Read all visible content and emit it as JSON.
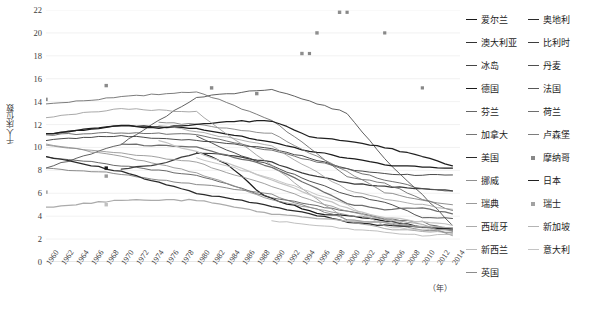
{
  "chart_data": {
    "type": "line",
    "title": "",
    "xlabel": "年",
    "ylabel": "千人床位数",
    "xlim": [
      1960,
      2015
    ],
    "ylim": [
      0,
      22
    ],
    "grid": true,
    "legend_position": "right",
    "x_ticks": [
      "1960",
      "1962",
      "1964",
      "1966",
      "1968",
      "1970",
      "1972",
      "1974",
      "1976",
      "1978",
      "1980",
      "1982",
      "1984",
      "1986",
      "1988",
      "1990",
      "1992",
      "1994",
      "1996",
      "1998",
      "2000",
      "2002",
      "2004",
      "2006",
      "2008",
      "2010",
      "2012",
      "2014"
    ],
    "y_ticks": [
      "0",
      "2",
      "4",
      "6",
      "8",
      "10",
      "12",
      "14",
      "16",
      "18",
      "20",
      "22"
    ],
    "series": [
      {
        "name": "爱尔兰",
        "color": "#1a1a1a",
        "mode": "line",
        "x": [
          1980,
          1982,
          1984,
          1986,
          1988,
          1990,
          1992,
          1994,
          1996,
          1998,
          2000,
          2002,
          2004,
          2006,
          2008,
          2010,
          2012,
          2014
        ],
        "values": [
          9.6,
          9.2,
          8.5,
          7.5,
          6.2,
          5.5,
          5.1,
          4.7,
          4.3,
          4.1,
          4.0,
          3.9,
          3.7,
          3.5,
          3.3,
          3.1,
          2.9,
          2.8
        ]
      },
      {
        "name": "奥地利",
        "color": "#2b2b2b",
        "mode": "line",
        "x": [
          1960,
          1965,
          1970,
          1975,
          1980,
          1985,
          1990,
          1995,
          2000,
          2005,
          2010,
          2014
        ],
        "values": [
          10.6,
          10.9,
          11.0,
          10.8,
          10.6,
          10.3,
          9.9,
          9.1,
          8.1,
          7.7,
          7.6,
          7.6
        ]
      },
      {
        "name": "澳大利亚",
        "color": "#333333",
        "mode": "line",
        "x": [
          1980,
          1985,
          1990,
          1995,
          2000,
          2005,
          2010,
          2014
        ],
        "values": [
          11.0,
          9.5,
          8.4,
          7.1,
          5.9,
          5.2,
          3.9,
          3.8
        ]
      },
      {
        "name": "比利时",
        "color": "#3d3d3d",
        "mode": "line",
        "x": [
          1970,
          1975,
          1980,
          1985,
          1990,
          1995,
          2000,
          2005,
          2010,
          2014
        ],
        "values": [
          8.1,
          8.5,
          9.5,
          9.3,
          8.7,
          7.6,
          6.9,
          6.6,
          6.4,
          6.2
        ]
      },
      {
        "name": "冰岛",
        "color": "#454545",
        "mode": "line",
        "x": [
          1960,
          1970,
          1980,
          1990,
          2000,
          2005,
          2010,
          2014
        ],
        "values": [
          8.2,
          10.3,
          14.4,
          15.1,
          13.0,
          9.0,
          5.9,
          3.2
        ]
      },
      {
        "name": "丹麦",
        "color": "#4f4f4f",
        "mode": "line",
        "x": [
          1960,
          1970,
          1980,
          1990,
          2000,
          2005,
          2010,
          2014
        ],
        "values": [
          9.2,
          8.4,
          7.6,
          5.6,
          4.4,
          3.8,
          3.5,
          2.7
        ]
      },
      {
        "name": "德国",
        "color": "#1c1c1c",
        "mode": "line",
        "x": [
          1960,
          1970,
          1980,
          1990,
          1995,
          2000,
          2005,
          2010,
          2014
        ],
        "values": [
          11.2,
          11.9,
          11.7,
          10.4,
          9.7,
          9.1,
          8.5,
          8.3,
          8.2
        ]
      },
      {
        "name": "法国",
        "color": "#575757",
        "mode": "line",
        "x": [
          1960,
          1970,
          1980,
          1990,
          2000,
          2005,
          2010,
          2014
        ],
        "values": [
          11.1,
          11.3,
          11.1,
          9.7,
          8.1,
          7.2,
          6.4,
          6.2
        ]
      },
      {
        "name": "芬兰",
        "color": "#666666",
        "mode": "line",
        "x": [
          1960,
          1970,
          1980,
          1990,
          2000,
          2005,
          2010,
          2014
        ],
        "values": [
          13.8,
          14.4,
          14.9,
          12.4,
          7.5,
          6.9,
          5.5,
          4.5
        ]
      },
      {
        "name": "荷兰",
        "color": "#6e6e6e",
        "mode": "line",
        "x": [
          1970,
          1980,
          1990,
          2000,
          2005,
          2010,
          2014
        ],
        "values": [
          10.3,
          10.0,
          8.3,
          5.1,
          4.6,
          4.7,
          4.2
        ]
      },
      {
        "name": "加拿大",
        "color": "#757575",
        "mode": "line",
        "x": [
          1960,
          1970,
          1976,
          1980,
          1990,
          2000,
          2005,
          2010,
          2014
        ],
        "values": [
          8.2,
          7.7,
          7.1,
          6.8,
          5.9,
          3.7,
          3.4,
          2.8,
          2.6
        ]
      },
      {
        "name": "卢森堡",
        "color": "#7d7d7d",
        "mode": "line",
        "x": [
          1975,
          1980,
          1990,
          2000,
          2005,
          2010,
          2014
        ],
        "values": [
          12.2,
          12.0,
          11.2,
          7.9,
          6.1,
          5.4,
          5.0
        ]
      },
      {
        "name": "美国",
        "color": "#2a2a2a",
        "mode": "line",
        "x": [
          1960,
          1970,
          1980,
          1990,
          2000,
          2005,
          2010,
          2014
        ],
        "values": [
          9.2,
          7.9,
          6.0,
          4.9,
          3.5,
          3.2,
          3.1,
          2.9
        ]
      },
      {
        "name": "摩纳哥",
        "color": "#888888",
        "mode": "marker",
        "x": [
          1995,
          2000,
          2005,
          2010
        ],
        "values": [
          18.2,
          21.8,
          20.0,
          15.2
        ]
      },
      {
        "name": "挪威",
        "color": "#909090",
        "mode": "line",
        "x": [
          1960,
          1970,
          1980,
          1990,
          2000,
          2005,
          2010,
          2014
        ],
        "values": [
          10.2,
          9.5,
          8.7,
          6.6,
          4.4,
          3.8,
          3.3,
          2.3
        ]
      },
      {
        "name": "日本",
        "color": "#202020",
        "mode": "line",
        "x": [
          1960,
          1965,
          1970,
          1975,
          1980,
          1985,
          1990,
          1995,
          2000,
          2005,
          2010,
          2014
        ],
        "values": [
          11.2,
          11.6,
          11.9,
          11.7,
          12.0,
          12.3,
          12.3,
          11.0,
          10.5,
          10.0,
          9.2,
          8.4
        ]
      },
      {
        "name": "瑞典",
        "color": "#9a9a9a",
        "mode": "line",
        "x": [
          1960,
          1970,
          1980,
          1990,
          2000,
          2005,
          2010,
          2014
        ],
        "values": [
          12.6,
          13.4,
          13.1,
          8.4,
          3.6,
          2.9,
          2.7,
          2.5
        ]
      },
      {
        "name": "瑞士",
        "color": "#a2a2a2",
        "mode": "line",
        "x": [
          1975,
          1980,
          1990,
          2000,
          2005,
          2010,
          2014
        ],
        "values": [
          11.9,
          11.4,
          10.1,
          6.3,
          5.5,
          5.0,
          4.6
        ]
      },
      {
        "name": "西班牙",
        "color": "#ababab",
        "mode": "line",
        "x": [
          1960,
          1970,
          1980,
          1990,
          2000,
          2005,
          2010,
          2014
        ],
        "values": [
          4.8,
          5.4,
          5.4,
          4.2,
          3.6,
          3.4,
          3.1,
          3.0
        ]
      },
      {
        "name": "新加坡",
        "color": "#b4b4b4",
        "mode": "line",
        "x": [
          1990,
          2000,
          2005,
          2010,
          2014
        ],
        "values": [
          3.6,
          2.9,
          2.6,
          2.3,
          2.4
        ]
      },
      {
        "name": "新西兰",
        "color": "#bcbcbc",
        "mode": "line",
        "x": [
          1980,
          1990,
          2000,
          2005,
          2010,
          2014
        ],
        "values": [
          9.1,
          7.3,
          5.0,
          3.1,
          2.8,
          2.8
        ]
      },
      {
        "name": "意大利",
        "color": "#c4c4c4",
        "mode": "line",
        "x": [
          1975,
          1980,
          1990,
          2000,
          2005,
          2010,
          2014
        ],
        "values": [
          10.6,
          9.6,
          7.2,
          4.7,
          3.9,
          3.5,
          3.2
        ]
      },
      {
        "name": "英国",
        "color": "#8c8c8c",
        "mode": "line",
        "x": [
          1960,
          1970,
          1980,
          1990,
          2000,
          2005,
          2010,
          2014
        ],
        "values": [
          10.3,
          9.2,
          7.8,
          5.4,
          4.1,
          3.7,
          3.0,
          2.7
        ]
      }
    ],
    "scatter_points": [
      {
        "name": "芬兰",
        "x": 1960,
        "y": 14.2,
        "color": "#8a8a8a"
      },
      {
        "name": "芬兰",
        "x": 1968,
        "y": 15.4,
        "color": "#8a8a8a"
      },
      {
        "name": "芬兰",
        "x": 1982,
        "y": 15.2,
        "color": "#8a8a8a"
      },
      {
        "name": "芬兰",
        "x": 1988,
        "y": 14.7,
        "color": "#8a8a8a"
      },
      {
        "name": "摩纳哥",
        "x": 1994,
        "y": 18.2,
        "color": "#8e8e8e"
      },
      {
        "name": "摩纳哥",
        "x": 1996,
        "y": 20.0,
        "color": "#8e8e8e"
      },
      {
        "name": "摩纳哥",
        "x": 1999,
        "y": 21.8,
        "color": "#8e8e8e"
      },
      {
        "name": "加拿大",
        "x": 1968,
        "y": 8.2,
        "color": "#1a1a1a"
      },
      {
        "name": "卢森堡",
        "x": 1968,
        "y": 7.5,
        "color": "#9a9a9a"
      },
      {
        "name": "西班牙",
        "x": 1960,
        "y": 6.1,
        "color": "#a8a8a8"
      },
      {
        "name": "新加坡",
        "x": 1968,
        "y": 5.0,
        "color": "#c0c0c0"
      }
    ]
  },
  "axis": {
    "y_title": "千人床位数",
    "x_unit": "（年）"
  },
  "legend": {
    "column1": [
      {
        "label": "爱尔兰",
        "color": "#1a1a1a",
        "mode": "line"
      },
      {
        "label": "澳大利亚",
        "color": "#333333",
        "mode": "line"
      },
      {
        "label": "冰岛",
        "color": "#454545",
        "mode": "line"
      },
      {
        "label": "德国",
        "color": "#1c1c1c",
        "mode": "line"
      },
      {
        "label": "芬兰",
        "color": "#666666",
        "mode": "line"
      },
      {
        "label": "加拿大",
        "color": "#757575",
        "mode": "line"
      },
      {
        "label": "美国",
        "color": "#2a2a2a",
        "mode": "line"
      },
      {
        "label": "挪威",
        "color": "#909090",
        "mode": "line"
      },
      {
        "label": "瑞典",
        "color": "#9a9a9a",
        "mode": "line"
      },
      {
        "label": "西班牙",
        "color": "#ababab",
        "mode": "line"
      },
      {
        "label": "新西兰",
        "color": "#bcbcbc",
        "mode": "line"
      },
      {
        "label": "英国",
        "color": "#8c8c8c",
        "mode": "blank"
      }
    ],
    "column2": [
      {
        "label": "奥地利",
        "color": "#2b2b2b",
        "mode": "line"
      },
      {
        "label": "比利时",
        "color": "#3d3d3d",
        "mode": "line"
      },
      {
        "label": "丹麦",
        "color": "#4f4f4f",
        "mode": "line"
      },
      {
        "label": "法国",
        "color": "#575757",
        "mode": "line"
      },
      {
        "label": "荷兰",
        "color": "#6e6e6e",
        "mode": "line"
      },
      {
        "label": "卢森堡",
        "color": "#7d7d7d",
        "mode": "line"
      },
      {
        "label": "摩纳哥",
        "color": "#888888",
        "mode": "marker"
      },
      {
        "label": "日本",
        "color": "#202020",
        "mode": "line"
      },
      {
        "label": "瑞士",
        "color": "#a2a2a2",
        "mode": "marker"
      },
      {
        "label": "新加坡",
        "color": "#b4b4b4",
        "mode": "blank"
      },
      {
        "label": "意大利",
        "color": "#c4c4c4",
        "mode": "blank"
      }
    ]
  }
}
